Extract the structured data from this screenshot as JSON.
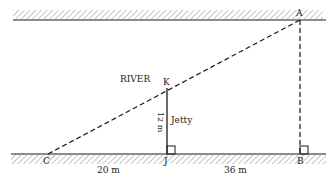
{
  "diagram": {
    "river_label": "RIVER",
    "points": {
      "A": "A",
      "B": "B",
      "C": "C",
      "J": "J",
      "K": "K"
    },
    "jetty_label": "Jetty",
    "jetty_length": "12 m",
    "cj_distance": "20 m",
    "jb_distance": "36 m",
    "colors": {
      "line": "#1a1a1a",
      "hatch": "#8a8a8a"
    }
  }
}
